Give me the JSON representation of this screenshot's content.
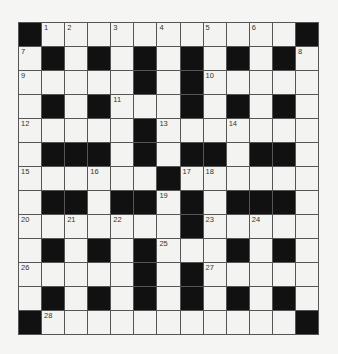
{
  "puzzle": {
    "rows": 13,
    "cols": 13,
    "colors": {
      "black_cell": "#111111",
      "white_cell": "#f3f3f1",
      "grid_line": "#555555",
      "number_text": "#333333",
      "background": "#f5f5f3"
    },
    "layout": [
      "#..........#",
      ".#.#.#.#.#.#.",
      ".....#.#.....",
      ".#.#...#.#.#.",
      ".....#.......",
      ".###.#.##.##.",
      "......#......",
      ".##.##.#.###.",
      ".......#.....",
      ".#.#.#...#.#.",
      ".....#.#.....",
      ".#.#.#.#.#.#.",
      "#...........#"
    ],
    "grid": [
      [
        "B",
        "1",
        "2",
        "",
        "3",
        "",
        "4",
        "",
        "5",
        "",
        "6",
        "",
        "B"
      ],
      [
        "7",
        "B",
        "",
        "B",
        "",
        "B",
        "",
        "B",
        "",
        "B",
        "",
        "B",
        "8"
      ],
      [
        "9",
        "",
        "",
        "",
        "",
        "B",
        "",
        "B",
        "10",
        "",
        "",
        "",
        ""
      ],
      [
        "",
        "B",
        "",
        "B",
        "11",
        "",
        "",
        "B",
        "",
        "B",
        "",
        "B",
        ""
      ],
      [
        "12",
        "",
        "",
        "",
        "",
        "B",
        "13",
        "",
        "",
        "14",
        "",
        "",
        ""
      ],
      [
        "",
        "B",
        "B",
        "B",
        "",
        "B",
        "",
        "B",
        "B",
        "",
        "B",
        "B",
        ""
      ],
      [
        "15",
        "",
        "",
        "16",
        "",
        "",
        "B",
        "17",
        "18",
        "",
        "",
        "",
        ""
      ],
      [
        "",
        "B",
        "B",
        "",
        "B",
        "B",
        "19",
        "B",
        "",
        "B",
        "B",
        "B",
        ""
      ],
      [
        "20",
        "",
        "21",
        "",
        "22",
        "",
        "",
        "B",
        "23",
        "",
        "24",
        "",
        ""
      ],
      [
        "",
        "B",
        "",
        "B",
        "",
        "B",
        "25",
        "",
        "",
        "B",
        "",
        "B",
        ""
      ],
      [
        "26",
        "",
        "",
        "",
        "",
        "B",
        "",
        "B",
        "27",
        "",
        "",
        "",
        ""
      ],
      [
        "",
        "B",
        "",
        "B",
        "",
        "B",
        "",
        "B",
        "",
        "B",
        "",
        "B",
        ""
      ],
      [
        "B",
        "28",
        "",
        "",
        "",
        "",
        "",
        "",
        "",
        "",
        "",
        "",
        "B"
      ]
    ]
  }
}
